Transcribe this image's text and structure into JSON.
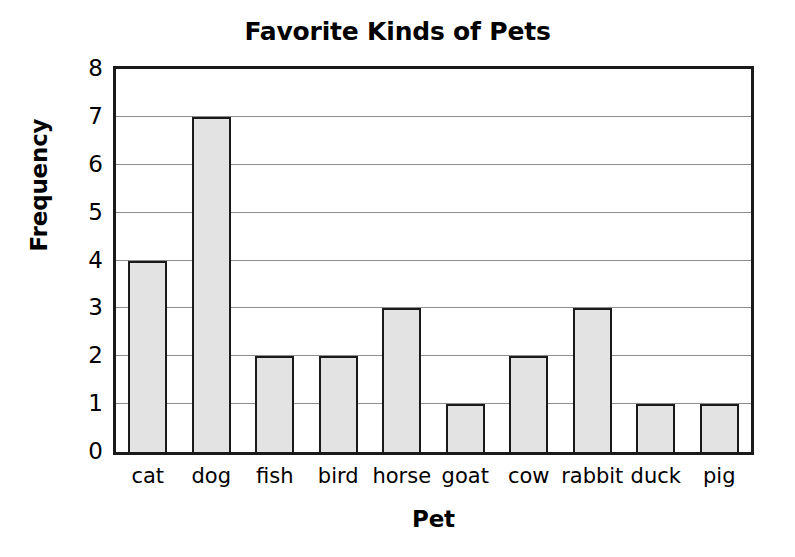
{
  "chart_data": {
    "type": "bar",
    "title": "Favorite Kinds of Pets",
    "xlabel": "Pet",
    "ylabel": "Frequency",
    "categories": [
      "cat",
      "dog",
      "fish",
      "bird",
      "horse",
      "goat",
      "cow",
      "rabbit",
      "duck",
      "pig"
    ],
    "values": [
      4,
      7,
      2,
      2,
      3,
      1,
      2,
      3,
      1,
      1
    ],
    "ylim": [
      0,
      8
    ],
    "y_ticks": [
      0,
      1,
      2,
      3,
      4,
      5,
      6,
      7,
      8
    ],
    "y_tick_labels": [
      "0",
      "1",
      "2",
      "3",
      "4",
      "5",
      "6",
      "7",
      "8"
    ],
    "grid": true,
    "grid_axis": "y",
    "legend": false,
    "bar_fill_color": "#e3e3e3",
    "bar_edge_color": "#1a1a1a",
    "gridline_color": "#8d8d8d",
    "axis_color": "#1a1a1a",
    "background_color": "#ffffff"
  }
}
